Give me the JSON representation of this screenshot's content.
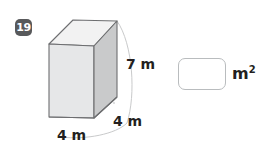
{
  "problem": {
    "number": "19",
    "badge_color": "#58595b",
    "badge_text_color": "#ffffff"
  },
  "figure": {
    "shape_name": "rectangular-prism",
    "fill_front": "#e8e8e8",
    "fill_side": "#c9cacb",
    "fill_top": "#f2f2f2",
    "edge_color": "#6d6e70",
    "hidden_edge_color": "#b7b8ba",
    "guide_color": "#c9cacb",
    "labels": {
      "height": "7 m",
      "depth": "4 m",
      "width": "4 m"
    }
  },
  "answer": {
    "value": "",
    "placeholder": "",
    "unit": "m",
    "unit_exponent": "2",
    "box_border_color": "#b9bcbe",
    "box_fill": "#ffffff"
  }
}
